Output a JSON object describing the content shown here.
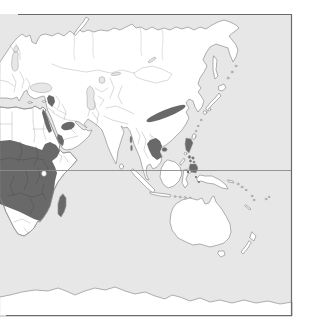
{
  "map": {
    "description": "Distribution range map of the Eastern Hemisphere showing Africa, Eurasia and Australasia with dark shaded range areas",
    "shaded_regions": [
      "Eastern and Central Africa",
      "Madagascar",
      "Red Sea hills (Egypt-Sudan coast)",
      "Levant patch",
      "Central Arabia patch",
      "Southwest Arabia coast",
      "Central China band",
      "Northern Indochina",
      "Hainan",
      "Andaman Islands",
      "Philippines (Luzon, Visayas, Mindanao)",
      "Wallacea islets"
    ],
    "unshaded_land": [
      "Europe",
      "Siberia",
      "India",
      "Australia",
      "New Zealand",
      "Antarctica",
      "Southern Africa tip",
      "Horn of Africa"
    ],
    "features": {
      "equator_line": "horizontal line across full map width",
      "frame": "border on top, right and bottom; map cropped at left edge",
      "lake_victoria": "small white lake inside African shaded area"
    },
    "colors": {
      "sea": "#e7e7e7",
      "land": "#ffffff",
      "coastline": "#8f8f8f",
      "country_border": "#b5b5b5",
      "range": "#696969",
      "equator": "#8a8a8a",
      "frame": "#6b6b6b",
      "page": "#ffffff"
    }
  }
}
